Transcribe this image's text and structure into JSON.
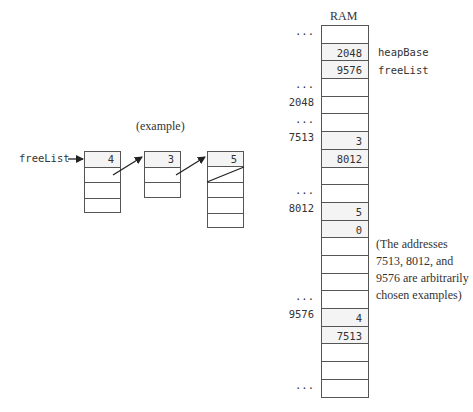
{
  "example": {
    "caption": "(example)",
    "pointer_label": "freeList",
    "blocks": [
      {
        "cells": [
          "4",
          "",
          "",
          ""
        ]
      },
      {
        "cells": [
          "3",
          "",
          ""
        ]
      },
      {
        "cells": [
          "5",
          "",
          "",
          "",
          ""
        ]
      }
    ]
  },
  "ram": {
    "title": "RAM",
    "rows": [
      {
        "addr": "...",
        "value": "",
        "label": ""
      },
      {
        "addr": "",
        "value": "2048",
        "label": "heapBase"
      },
      {
        "addr": "",
        "value": "9576",
        "label": "freeList"
      },
      {
        "addr": "...",
        "value": "",
        "label": ""
      },
      {
        "addr": "2048",
        "value": "",
        "label": ""
      },
      {
        "addr": "...",
        "value": "",
        "label": ""
      },
      {
        "addr": "7513",
        "value": "3",
        "label": ""
      },
      {
        "addr": "",
        "value": "8012",
        "label": ""
      },
      {
        "addr": "",
        "value": "",
        "label": ""
      },
      {
        "addr": "...",
        "value": "",
        "label": ""
      },
      {
        "addr": "8012",
        "value": "5",
        "label": ""
      },
      {
        "addr": "",
        "value": "0",
        "label": ""
      },
      {
        "addr": "",
        "value": "",
        "label": ""
      },
      {
        "addr": "",
        "value": "",
        "label": ""
      },
      {
        "addr": "",
        "value": "",
        "label": ""
      },
      {
        "addr": "...",
        "value": "",
        "label": ""
      },
      {
        "addr": "9576",
        "value": "4",
        "label": ""
      },
      {
        "addr": "",
        "value": "7513",
        "label": ""
      },
      {
        "addr": "",
        "value": "",
        "label": ""
      },
      {
        "addr": "",
        "value": "",
        "label": ""
      },
      {
        "addr": "...",
        "value": "",
        "label": ""
      }
    ]
  },
  "annotation": {
    "lines": [
      "(The addresses",
      "7513, 8012, and",
      "9576 are arbitrarily",
      "chosen examples)"
    ]
  }
}
